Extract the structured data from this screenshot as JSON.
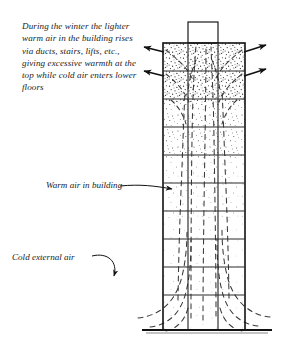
{
  "figure": {
    "caption": "During the winter the lighter warm air in the building rises via ducts, stairs, lifts, etc., giving excessive warmth at the top while cold air enters lower floors",
    "labels": {
      "warm_air": "Warm air in building",
      "cold_air": "Cold external air"
    },
    "colors": {
      "ink": "#1b1b1b",
      "outline": "#111111",
      "stipple": "#2a2a2a",
      "paper": "#ffffff",
      "grid": "#2b2b2b"
    },
    "building": {
      "floors": 10,
      "bays": 3,
      "has_roof_penthouse": true,
      "ground_line": true
    },
    "arrows": {
      "warm_air_out_left": 2,
      "warm_air_out_right": 2,
      "description": "Arrows at the top of the building point outward on both sides showing warm air leaving"
    },
    "airflow": {
      "rising_lines": "dashed vertical lines rising through building core",
      "entering_curves": "dashed curves sweeping in at lower floors from both sides"
    }
  }
}
